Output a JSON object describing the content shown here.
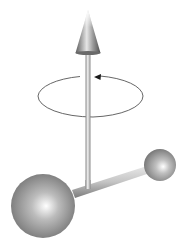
{
  "diagram": {
    "background_color": "#ffffff",
    "rotation_axis": {
      "label": "rotation-axis-arrow",
      "color": "#9a9a9a",
      "arrowhead_color": "#6e6e6e"
    },
    "rotation_indicator": {
      "label": "rotation-circle",
      "direction": "counterclockwise (viewed from above)",
      "stroke_color": "#555555"
    },
    "atoms": [
      {
        "id": "large-atom",
        "color": "#9a9a9a"
      },
      {
        "id": "small-atom",
        "color": "#9a9a9a"
      }
    ],
    "bond": {
      "color": "#bdbdbd"
    }
  }
}
